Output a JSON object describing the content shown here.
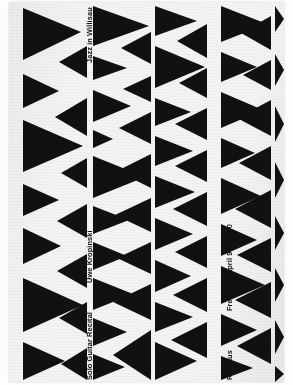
{
  "poster": {
    "kind": "concert-poster",
    "series_title": "Jazz in Willisau",
    "artist": "Uwe Kropinski",
    "program": "Solo Guitar Recital",
    "date_time": "Freitag 3. April 98, 20.30",
    "venue": "Rathaus",
    "colors": {
      "ink": "#111111",
      "paper": "#f4f3f1",
      "backdrop": "#fdfdfd"
    },
    "graphic": {
      "motif": "black-triangles",
      "columns": 5,
      "orientation": "portrait"
    }
  },
  "triangles": [
    [
      14,
      6,
      14,
      58,
      72,
      30
    ],
    [
      14,
      72,
      14,
      106,
      50,
      89
    ],
    [
      14,
      118,
      14,
      170,
      74,
      144
    ],
    [
      14,
      182,
      14,
      214,
      50,
      198
    ],
    [
      14,
      226,
      14,
      262,
      52,
      244
    ],
    [
      14,
      276,
      14,
      330,
      74,
      303
    ],
    [
      14,
      340,
      14,
      378,
      56,
      359
    ],
    [
      78,
      44,
      78,
      76,
      50,
      60
    ],
    [
      78,
      96,
      78,
      134,
      46,
      115
    ],
    [
      78,
      156,
      78,
      186,
      52,
      171
    ],
    [
      78,
      202,
      78,
      236,
      48,
      219
    ],
    [
      78,
      252,
      78,
      286,
      48,
      269
    ],
    [
      78,
      300,
      78,
      332,
      50,
      316
    ],
    [
      78,
      346,
      78,
      378,
      52,
      362
    ],
    [
      84,
      4,
      84,
      44,
      140,
      24
    ],
    [
      84,
      54,
      84,
      78,
      118,
      66
    ],
    [
      84,
      88,
      84,
      120,
      122,
      104
    ],
    [
      84,
      128,
      84,
      146,
      104,
      137
    ],
    [
      84,
      154,
      84,
      196,
      136,
      175
    ],
    [
      84,
      204,
      84,
      232,
      120,
      218
    ],
    [
      84,
      240,
      84,
      268,
      118,
      254
    ],
    [
      84,
      276,
      84,
      308,
      124,
      292
    ],
    [
      84,
      316,
      84,
      344,
      118,
      330
    ],
    [
      84,
      352,
      84,
      378,
      116,
      365
    ],
    [
      142,
      30,
      142,
      62,
      112,
      46
    ],
    [
      142,
      74,
      142,
      100,
      114,
      87
    ],
    [
      142,
      110,
      142,
      142,
      110,
      126
    ],
    [
      142,
      152,
      142,
      186,
      108,
      169
    ],
    [
      142,
      196,
      142,
      230,
      106,
      213
    ],
    [
      142,
      240,
      142,
      272,
      108,
      256
    ],
    [
      142,
      282,
      142,
      318,
      104,
      300
    ],
    [
      142,
      328,
      142,
      378,
      104,
      353
    ],
    [
      146,
      4,
      146,
      34,
      188,
      19
    ],
    [
      146,
      44,
      146,
      86,
      196,
      65
    ],
    [
      146,
      96,
      146,
      124,
      182,
      110
    ],
    [
      146,
      134,
      146,
      164,
      184,
      149
    ],
    [
      146,
      174,
      146,
      206,
      186,
      190
    ],
    [
      146,
      216,
      146,
      248,
      184,
      232
    ],
    [
      146,
      258,
      146,
      290,
      182,
      274
    ],
    [
      146,
      300,
      146,
      330,
      184,
      315
    ],
    [
      146,
      340,
      146,
      378,
      188,
      359
    ],
    [
      198,
      22,
      198,
      56,
      168,
      39
    ],
    [
      198,
      66,
      198,
      96,
      170,
      81
    ],
    [
      198,
      106,
      198,
      138,
      166,
      122
    ],
    [
      198,
      148,
      198,
      180,
      166,
      164
    ],
    [
      198,
      190,
      198,
      224,
      164,
      207
    ],
    [
      198,
      234,
      198,
      266,
      166,
      250
    ],
    [
      198,
      276,
      198,
      310,
      164,
      293
    ],
    [
      198,
      320,
      198,
      356,
      162,
      338
    ],
    [
      212,
      4,
      212,
      40,
      258,
      22
    ],
    [
      212,
      50,
      212,
      80,
      248,
      65
    ],
    [
      212,
      90,
      212,
      126,
      254,
      108
    ],
    [
      212,
      136,
      212,
      166,
      246,
      151
    ],
    [
      212,
      176,
      212,
      212,
      252,
      194
    ],
    [
      212,
      222,
      212,
      254,
      248,
      238
    ],
    [
      212,
      264,
      212,
      302,
      256,
      283
    ],
    [
      212,
      312,
      212,
      344,
      248,
      328
    ],
    [
      212,
      354,
      212,
      378,
      244,
      366
    ],
    [
      262,
      14,
      262,
      48,
      232,
      31
    ],
    [
      262,
      58,
      262,
      88,
      234,
      73
    ],
    [
      262,
      98,
      262,
      134,
      228,
      116
    ],
    [
      262,
      144,
      262,
      178,
      230,
      161
    ],
    [
      262,
      188,
      262,
      226,
      226,
      207
    ],
    [
      262,
      236,
      262,
      270,
      228,
      253
    ],
    [
      262,
      280,
      262,
      316,
      226,
      298
    ],
    [
      262,
      326,
      262,
      362,
      228,
      344
    ],
    [
      266,
      4,
      266,
      30,
      275,
      17
    ],
    [
      266,
      52,
      266,
      84,
      275,
      68
    ],
    [
      266,
      104,
      266,
      140,
      275,
      122
    ],
    [
      266,
      160,
      266,
      196,
      275,
      178
    ],
    [
      266,
      214,
      266,
      248,
      275,
      231
    ],
    [
      266,
      266,
      266,
      300,
      275,
      283
    ],
    [
      266,
      318,
      266,
      352,
      275,
      335
    ],
    [
      266,
      364,
      266,
      380,
      275,
      372
    ]
  ]
}
